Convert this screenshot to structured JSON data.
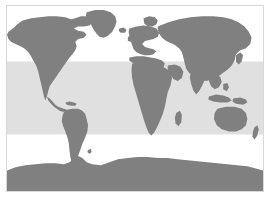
{
  "figure": {
    "type": "world-map",
    "width": 270,
    "height": 198,
    "background_color": "#ffffff"
  },
  "frame": {
    "border_color": "#d8d8d8",
    "border_width": 1,
    "inset_left": 6,
    "inset_top": 5,
    "width": 258,
    "height": 187
  },
  "map": {
    "projection": "equirectangular",
    "ocean_color": "#ffffff",
    "land_color": "#808080",
    "highlight_band_color": "#e0e0e0",
    "lon_range": [
      -180,
      180
    ],
    "lat_range": [
      -90,
      90
    ]
  },
  "chart_data": {
    "type": "map",
    "projection": "equirectangular",
    "xlabel": "Longitude",
    "ylabel": "Latitude",
    "xlim": [
      -180,
      180
    ],
    "ylim": [
      -90,
      90
    ],
    "grid": false,
    "legend": null,
    "land_color": "#808080",
    "ocean_color": "#ffffff",
    "highlight_band": {
      "label": "Highlighted latitude band",
      "color": "#e0e0e0",
      "lat_min": -35,
      "lat_max": 36,
      "pixel_top": 60,
      "pixel_bottom": 131
    },
    "regions": [
      {
        "name": "North America",
        "visible": true
      },
      {
        "name": "Greenland",
        "visible": true
      },
      {
        "name": "South America",
        "visible": true
      },
      {
        "name": "Europe",
        "visible": true
      },
      {
        "name": "Africa",
        "visible": true
      },
      {
        "name": "Asia",
        "visible": true
      },
      {
        "name": "Australia",
        "visible": true
      },
      {
        "name": "New Zealand",
        "visible": true
      },
      {
        "name": "Antarctica",
        "visible": true
      }
    ]
  }
}
